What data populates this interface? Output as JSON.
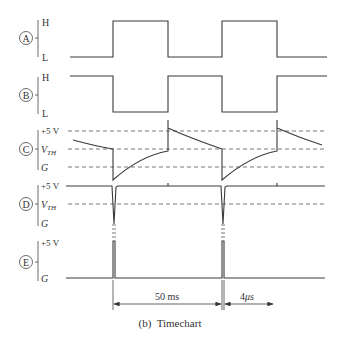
{
  "caption": "(b)  Timechart",
  "signals": [
    {
      "id": "A",
      "marker": "A",
      "levels": [
        "H",
        "L"
      ]
    },
    {
      "id": "B",
      "marker": "B",
      "levels": [
        "H",
        "L"
      ]
    },
    {
      "id": "C",
      "marker": "C",
      "levels": [
        "+5 V",
        "V",
        "G"
      ],
      "vth_sub": "TH"
    },
    {
      "id": "D",
      "marker": "D",
      "levels": [
        "+5 V",
        "V",
        "G"
      ],
      "vth_sub": "TH"
    },
    {
      "id": "E",
      "marker": "E",
      "levels": [
        "+5 V",
        "G"
      ]
    }
  ],
  "dimensions": {
    "period": "50 ms",
    "pulse_width_num": "4",
    "pulse_width_unit": "μs"
  },
  "colors": {
    "line": "#3a3a3a",
    "dashed": "#555555",
    "text": "#333333"
  }
}
